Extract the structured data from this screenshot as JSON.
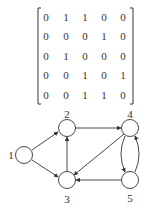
{
  "matrix": {
    "label": "adjacency-matrix",
    "rows": [
      [
        "0",
        "1",
        "1",
        "0",
        "0"
      ],
      [
        "0",
        "0",
        "0",
        "1",
        "0"
      ],
      [
        "0",
        "1",
        "0",
        "0",
        "0"
      ],
      [
        "0",
        "0",
        "1",
        "0",
        "1"
      ],
      [
        "0",
        "0",
        "1",
        "1",
        "0"
      ]
    ]
  },
  "graph": {
    "nodes": [
      {
        "id": "1",
        "label": "1"
      },
      {
        "id": "2",
        "label": "2"
      },
      {
        "id": "3",
        "label": "3"
      },
      {
        "id": "4",
        "label": "4"
      },
      {
        "id": "5",
        "label": "5"
      }
    ],
    "edges": [
      {
        "from": "1",
        "to": "2"
      },
      {
        "from": "1",
        "to": "3"
      },
      {
        "from": "2",
        "to": "4"
      },
      {
        "from": "3",
        "to": "2"
      },
      {
        "from": "4",
        "to": "3"
      },
      {
        "from": "4",
        "to": "5"
      },
      {
        "from": "5",
        "to": "3"
      },
      {
        "from": "5",
        "to": "4"
      }
    ],
    "colors": {
      "stroke": "#333333",
      "background": "#ffffff"
    }
  }
}
